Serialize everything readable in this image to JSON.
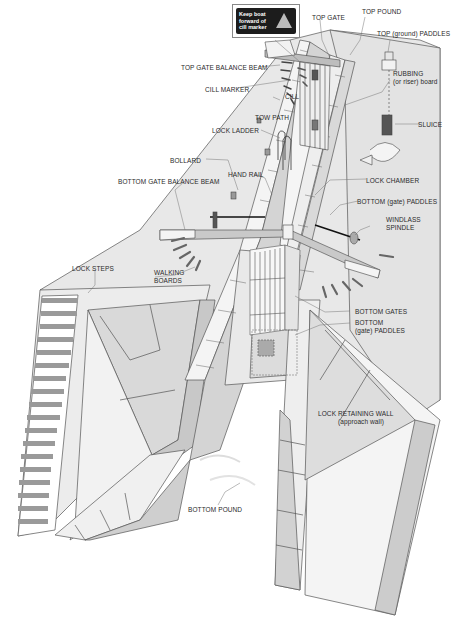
{
  "diagram": {
    "sign": {
      "text": "Keep boat\nforward of\ncill marker",
      "icon": "warning-triangle-icon"
    },
    "labels": {
      "top_gate": "TOP GATE",
      "top_pound": "TOP POUND",
      "top_paddles": "TOP (ground) PADDLES",
      "top_gate_balance_beam": "TOP GATE BALANCE BEAM",
      "rubbing_board_1": "RUBBING",
      "rubbing_board_2": "(or riser) board",
      "cill_marker": "CILL MARKER",
      "cill": "CILL",
      "tow_path": "TOW PATH",
      "sluice": "SLUICE",
      "lock_ladder": "LOCK LADDER",
      "bollard": "BOLLARD",
      "hand_rail": "HAND RAIL",
      "lock_chamber": "LOCK CHAMBER",
      "bottom_gate_balance_beam": "BOTTOM GATE BALANCE BEAM",
      "bottom_gate_paddles": "BOTTOM (gate) PADDLES",
      "windlass_1": "WINDLASS",
      "windlass_2": "SPINDLE",
      "lock_steps": "LOCK STEPS",
      "walking_boards_1": "WALKING",
      "walking_boards_2": "BOARDS",
      "bottom_gates": "BOTTOM GATES",
      "bottom_paddles_1": "BOTTOM",
      "bottom_paddles_2": "(gate) PADDLES",
      "retaining_wall_1": "LOCK RETAINING WALL",
      "retaining_wall_2": "(approach wall)",
      "bottom_pound": "BOTTOM POUND"
    },
    "colors": {
      "ground": "#e6e6e6",
      "wall_light": "#f0f0f0",
      "wall_mid": "#cfcfcf",
      "wall_dark": "#b5b5b5",
      "line": "#444444",
      "water": "#f7f7f7"
    }
  }
}
